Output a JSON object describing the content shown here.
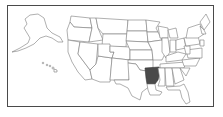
{
  "map": {
    "title": "United States",
    "highlighted_state": "Arkansas",
    "highlight_color": "#4a4a4a",
    "border_color": "#4a4a4a",
    "state_stroke_color": "#7a7a7a",
    "insets": [
      "Alaska",
      "Hawaii"
    ]
  }
}
